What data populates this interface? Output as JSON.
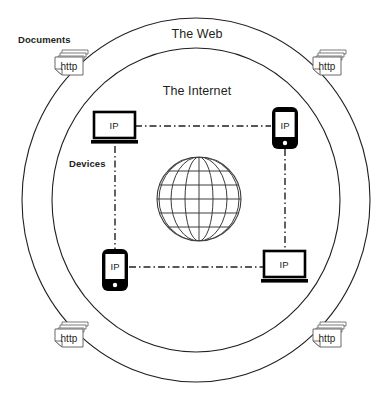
{
  "diagram": {
    "title_web": "The Web",
    "title_internet": "The Internet",
    "label_documents": "Documents",
    "label_devices": "Devices",
    "stroke_color": "#231f20",
    "fill_white": "#ffffff",
    "rings": [
      {
        "name": "web-ring",
        "label": "The Web"
      },
      {
        "name": "internet-ring",
        "label": "The Internet"
      }
    ],
    "documents": [
      {
        "id": "doc-top-left",
        "label": "http",
        "x": 54,
        "y": 50
      },
      {
        "id": "doc-top-right",
        "label": "http",
        "x": 312,
        "y": 50
      },
      {
        "id": "doc-bottom-left",
        "label": "http",
        "x": 54,
        "y": 322
      },
      {
        "id": "doc-bottom-right",
        "label": "http",
        "x": 312,
        "y": 322
      }
    ],
    "devices": [
      {
        "id": "device-laptop-top-left",
        "type": "laptop",
        "label": "IP",
        "x": 94,
        "y": 112
      },
      {
        "id": "device-phone-top-right",
        "type": "phone",
        "label": "IP",
        "x": 272,
        "y": 107
      },
      {
        "id": "device-phone-bottom-left",
        "type": "phone",
        "label": "IP",
        "x": 102,
        "y": 249
      },
      {
        "id": "device-laptop-bottom-right",
        "type": "laptop",
        "label": "IP",
        "x": 264,
        "y": 251
      }
    ],
    "connections": [
      {
        "id": "link-top",
        "from": "device-laptop-top-left",
        "to": "device-phone-top-right",
        "style": "dash-dot"
      },
      {
        "id": "link-bottom",
        "from": "device-phone-bottom-left",
        "to": "device-laptop-bottom-right",
        "style": "dash-dot"
      },
      {
        "id": "link-left",
        "from": "device-laptop-top-left",
        "to": "device-phone-bottom-left",
        "style": "dash-dot"
      },
      {
        "id": "link-right",
        "from": "device-phone-top-right",
        "to": "device-laptop-bottom-right",
        "style": "dash-dot"
      }
    ],
    "globe": {
      "id": "globe",
      "cx": 199,
      "cy": 199,
      "r": 42,
      "meridians": 7,
      "parallels": 5
    }
  }
}
